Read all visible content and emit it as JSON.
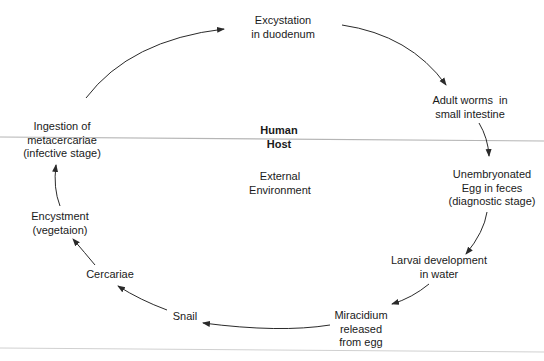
{
  "diagram": {
    "type": "life-cycle",
    "center_labels": {
      "upper": [
        "Human",
        "Host"
      ],
      "lower": [
        "External",
        "Environment"
      ]
    },
    "nodes": [
      {
        "id": "excystation",
        "lines": [
          "Excystation",
          "in duodenum"
        ]
      },
      {
        "id": "adult-worms",
        "lines": [
          "Adult worms  in",
          "small intestine"
        ]
      },
      {
        "id": "unembryonated-egg",
        "lines": [
          "Unembryonated",
          "Egg in feces",
          "(diagnostic stage)"
        ]
      },
      {
        "id": "larval-development",
        "lines": [
          "Larvai development",
          "in water"
        ]
      },
      {
        "id": "miracidium",
        "lines": [
          "Miracidium",
          "released",
          "from egg"
        ]
      },
      {
        "id": "snail",
        "lines": [
          "Snail"
        ]
      },
      {
        "id": "cercariae",
        "lines": [
          "Cercariae"
        ]
      },
      {
        "id": "encystment",
        "lines": [
          "Encystment",
          "(vegetaion)"
        ]
      },
      {
        "id": "ingestion",
        "lines": [
          "Ingestion of",
          "metacercariae",
          "(infective stage)"
        ]
      }
    ],
    "edges": [
      {
        "from": "ingestion",
        "to": "excystation"
      },
      {
        "from": "excystation",
        "to": "adult-worms"
      },
      {
        "from": "adult-worms",
        "to": "unembryonated-egg"
      },
      {
        "from": "unembryonated-egg",
        "to": "larval-development"
      },
      {
        "from": "larval-development",
        "to": "miracidium"
      },
      {
        "from": "miracidium",
        "to": "snail"
      },
      {
        "from": "snail",
        "to": "cercariae"
      },
      {
        "from": "cercariae",
        "to": "encystment"
      },
      {
        "from": "encystment",
        "to": "ingestion"
      }
    ],
    "colors": {
      "text": "#1a1a1a",
      "arrow": "#2a2a2a",
      "divider": "#b0b0b0"
    }
  }
}
